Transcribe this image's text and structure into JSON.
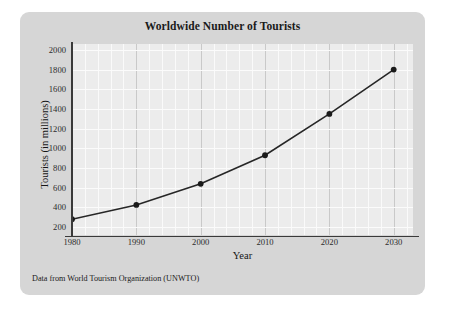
{
  "card": {
    "background_color": "#d6d6d6",
    "plot_background_color": "#ececec"
  },
  "caption": "Data from World Tourism Organization (UNWTO)",
  "chart_data": {
    "type": "line",
    "title": "Worldwide Number of Tourists",
    "xlabel": "Year",
    "ylabel": "Tourists (in millions)",
    "x": [
      1980,
      1990,
      2000,
      2010,
      2020,
      2030
    ],
    "values": [
      280,
      425,
      640,
      930,
      1350,
      1800
    ],
    "categories": [
      "1980",
      "1990",
      "2000",
      "2010",
      "2020",
      "2030"
    ],
    "xlim": [
      1980,
      2033
    ],
    "ylim": [
      120,
      2060
    ],
    "xticks": [
      "1980",
      "1990",
      "2000",
      "2010",
      "2020",
      "2030"
    ],
    "yticks": [
      "200",
      "400",
      "600",
      "800",
      "1000",
      "1200",
      "1400",
      "1600",
      "1800",
      "2000"
    ],
    "ytick_values": [
      200,
      400,
      600,
      800,
      1000,
      1200,
      1400,
      1600,
      1800,
      2000
    ],
    "xtick_values": [
      1980,
      1990,
      2000,
      2010,
      2020,
      2030
    ],
    "minor_xtick_step": 2,
    "grid": true,
    "legend": null,
    "legend_position": "none",
    "series": [
      {
        "name": "Worldwide tourists",
        "values": [
          280,
          425,
          640,
          930,
          1350,
          1800
        ],
        "line_color": "#262626",
        "marker": "circle",
        "marker_color": "#1a1a1a"
      }
    ]
  }
}
